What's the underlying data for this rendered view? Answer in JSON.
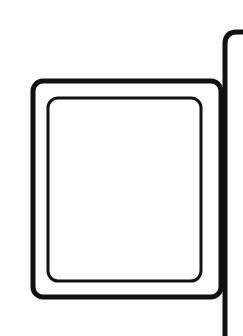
{
  "diagram": {
    "colors": {
      "background": "#ffffff",
      "stroke": "#111111"
    },
    "shapes": {
      "outer_frame": {
        "x": 33,
        "y": 81,
        "width": 188,
        "height": 216,
        "radius": 10,
        "stroke_width": 5
      },
      "inner_frame": {
        "x": 48,
        "y": 98,
        "width": 153,
        "height": 183,
        "radius": 10,
        "stroke_width": 3
      },
      "panel_edge": {
        "x": 225,
        "top": 32,
        "bottom": 336,
        "corner_radius": 12,
        "stroke_width": 5
      }
    }
  }
}
